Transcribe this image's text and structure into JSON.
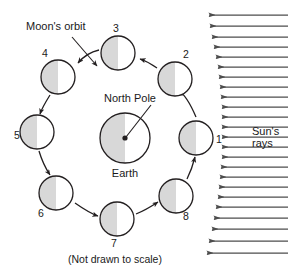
{
  "figure": {
    "title_text_elements": {
      "moon_orbit_label": "Moon's orbit",
      "north_pole_label": "North Pole",
      "earth_label": "Earth",
      "suns_rays_line1": "Sun's",
      "suns_rays_line2": "rays",
      "scale_note": "(Not drawn to scale)"
    },
    "colors": {
      "stroke": "#231f20",
      "shade_fill": "#d8d8d8",
      "lit_fill": "#ffffff",
      "ray_color": "#4d4d4d",
      "background": "#ffffff"
    },
    "earth": {
      "label": "Earth",
      "pole_label": "North Pole",
      "cx": 125,
      "cy": 138,
      "r": 25,
      "shaded_side": "left"
    },
    "moons": [
      {
        "label": "1",
        "cx": 196,
        "cy": 138,
        "r": 17,
        "shaded_side": "left",
        "label_x": 219,
        "label_y": 143
      },
      {
        "label": "2",
        "cx": 175,
        "cy": 79,
        "r": 17,
        "shaded_side": "left",
        "label_x": 186,
        "label_y": 58
      },
      {
        "label": "3",
        "cx": 118,
        "cy": 53,
        "r": 17,
        "shaded_side": "left",
        "label_x": 116,
        "label_y": 32
      },
      {
        "label": "4",
        "cx": 58,
        "cy": 77,
        "r": 17,
        "shaded_side": "left",
        "label_x": 45,
        "label_y": 57
      },
      {
        "label": "5",
        "cx": 37,
        "cy": 132,
        "r": 17,
        "shaded_side": "left",
        "label_x": 17,
        "label_y": 139
      },
      {
        "label": "6",
        "cx": 56,
        "cy": 193,
        "r": 17,
        "shaded_side": "left",
        "label_x": 41,
        "label_y": 217
      },
      {
        "label": "7",
        "cx": 117,
        "cy": 219,
        "r": 17,
        "shaded_side": "left",
        "label_x": 114,
        "label_y": 247
      },
      {
        "label": "8",
        "cx": 176,
        "cy": 196,
        "r": 17,
        "shaded_side": "left",
        "label_x": 186,
        "label_y": 220
      }
    ],
    "orbit_arrows": [
      {
        "from": "1",
        "to": "2",
        "path": "M 196 117 C 190 103 184 94 179 91"
      },
      {
        "from": "2",
        "to": "3",
        "path": "M 157 68 C 150 63 146 61 140 59"
      },
      {
        "from": "3",
        "to": "4",
        "path": "M 99 50 C 90 52 83 57 78 63"
      },
      {
        "from": "4",
        "to": "5",
        "path": "M 50 95 C 45 103 42 108 40 114"
      },
      {
        "from": "5",
        "to": "6",
        "path": "M 39 151 C 42 161 46 169 50 175"
      },
      {
        "from": "6",
        "to": "7",
        "path": "M 75 203 C 85 210 92 214 98 216"
      },
      {
        "from": "7",
        "to": "8",
        "path": "M 136 214 C 146 210 152 206 158 202"
      },
      {
        "from": "8",
        "to": "1",
        "path": "M 187 179 C 192 169 194 161 195 157"
      }
    ],
    "leader_lines": {
      "moon_orbit": {
        "path": "M 72 37 L 97 66",
        "label_x": 26,
        "label_y": 30
      },
      "north_pole": {
        "path": "M 151 105 L 126 137",
        "label_x": 104,
        "label_y": 102
      }
    },
    "suns_rays": {
      "label_line1": "Sun's",
      "label_line2": "rays",
      "label_x": 252,
      "label_y1": 135,
      "label_y2": 147,
      "direction": "right-to-left",
      "count": 24,
      "right_x": 288,
      "rays": [
        {
          "y": 15,
          "tip_x": 209
        },
        {
          "y": 26,
          "tip_x": 210
        },
        {
          "y": 37,
          "tip_x": 212
        },
        {
          "y": 47,
          "tip_x": 214
        },
        {
          "y": 57,
          "tip_x": 216
        },
        {
          "y": 67,
          "tip_x": 218
        },
        {
          "y": 77,
          "tip_x": 219
        },
        {
          "y": 87,
          "tip_x": 220
        },
        {
          "y": 97,
          "tip_x": 221
        },
        {
          "y": 107,
          "tip_x": 222
        },
        {
          "y": 117,
          "tip_x": 222
        },
        {
          "y": 127,
          "tip_x": 222
        },
        {
          "y": 137,
          "tip_x": 222
        },
        {
          "y": 147,
          "tip_x": 222
        },
        {
          "y": 157,
          "tip_x": 222
        },
        {
          "y": 167,
          "tip_x": 221
        },
        {
          "y": 177,
          "tip_x": 220
        },
        {
          "y": 187,
          "tip_x": 219
        },
        {
          "y": 197,
          "tip_x": 218
        },
        {
          "y": 207,
          "tip_x": 216
        },
        {
          "y": 218,
          "tip_x": 214
        },
        {
          "y": 229,
          "tip_x": 212
        },
        {
          "y": 241,
          "tip_x": 209
        },
        {
          "y": 253,
          "tip_x": 207
        }
      ]
    },
    "scale_note": {
      "text": "(Not drawn to scale)",
      "x": 68,
      "y": 263
    }
  }
}
